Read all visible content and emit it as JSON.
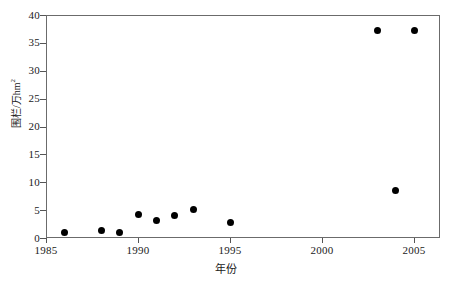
{
  "chart_data": {
    "type": "scatter",
    "title": "",
    "xlabel": "年份",
    "ylabel": "围栏/万hm²",
    "ylabel_main": "围栏/万hm",
    "ylabel_sup": "2",
    "xlim": [
      1985,
      2006
    ],
    "ylim": [
      0,
      40
    ],
    "grid": false,
    "legend": null,
    "x_ticks": [
      "1985",
      "1990",
      "1995",
      "2000",
      "2005"
    ],
    "x_tick_values": [
      1985,
      1990,
      1995,
      2000,
      2005
    ],
    "y_ticks": [
      "0",
      "5",
      "10",
      "15",
      "20",
      "25",
      "30",
      "35",
      "40"
    ],
    "y_tick_values": [
      0,
      5,
      10,
      15,
      20,
      25,
      30,
      35,
      40
    ],
    "series": [
      {
        "name": "围栏面积",
        "marker": "filled-circle",
        "color": "#000000",
        "points": [
          {
            "x": 1986,
            "y": 1.0
          },
          {
            "x": 1988,
            "y": 1.4
          },
          {
            "x": 1989,
            "y": 1.0
          },
          {
            "x": 1990,
            "y": 4.3
          },
          {
            "x": 1991,
            "y": 3.2
          },
          {
            "x": 1992,
            "y": 4.0
          },
          {
            "x": 1993,
            "y": 5.1
          },
          {
            "x": 1995,
            "y": 2.8
          },
          {
            "x": 2003,
            "y": 37.2
          },
          {
            "x": 2004,
            "y": 8.5
          },
          {
            "x": 2005,
            "y": 37.2
          }
        ]
      }
    ]
  },
  "style": {
    "frame_color": "#6b6b6b",
    "tick_color": "#555555",
    "text_color": "#1a1a1a",
    "marker_color": "#000000",
    "background": "#ffffff"
  }
}
